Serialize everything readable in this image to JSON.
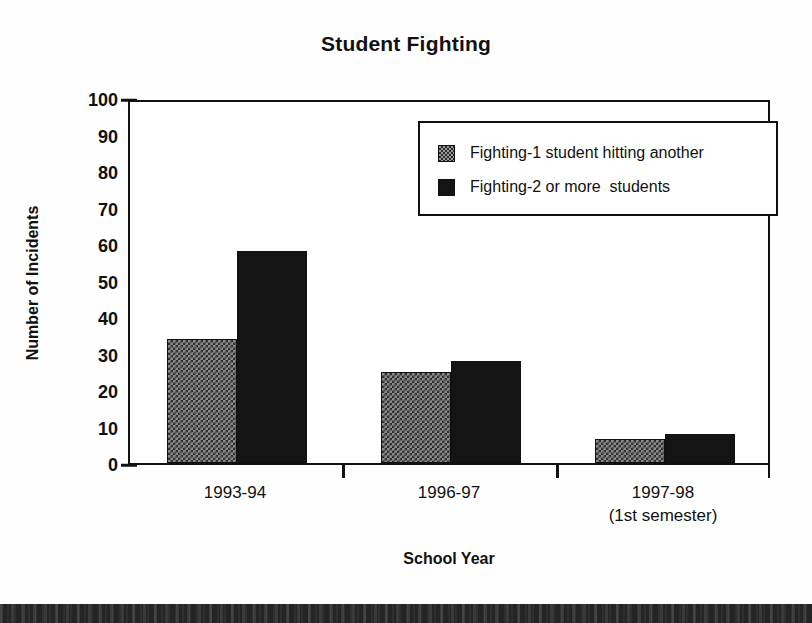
{
  "chart_data": {
    "type": "bar",
    "title": "Student Fighting",
    "xlabel": "School Year",
    "ylabel": "Number of Incidents",
    "categories": [
      "1993-94",
      "1996-97",
      "1997-98"
    ],
    "category_sublabels": [
      "",
      "",
      "(1st semester)"
    ],
    "series": [
      {
        "name": "Fighting-1 student hitting another",
        "values": [
          34,
          25,
          6.5
        ],
        "color": "#8a8a8a",
        "pattern": "checkerboard"
      },
      {
        "name": "Fighting-2 or more  students",
        "values": [
          58,
          28,
          8
        ],
        "color": "#141414",
        "pattern": "solid"
      }
    ],
    "ylim": [
      0,
      100
    ],
    "ytick_values": [
      0,
      10,
      20,
      30,
      40,
      50,
      60,
      70,
      80,
      90,
      100
    ],
    "ytick_labels": [
      "0",
      "10",
      "20",
      "30",
      "40",
      "50",
      "60",
      "70",
      "80",
      "90",
      "100"
    ],
    "grid": false,
    "legend_position": "upper-right-inside",
    "frame": true
  },
  "legend": {
    "entries": [
      {
        "label": "Fighting-1 student hitting another",
        "swatch": "hatched-gray-swatch"
      },
      {
        "label": "Fighting-2 or more  students",
        "swatch": "solid-black-swatch"
      }
    ]
  },
  "page": {
    "background_color": "#ffffff",
    "ink_color": "#111111",
    "scan_band_color": "#242424"
  }
}
